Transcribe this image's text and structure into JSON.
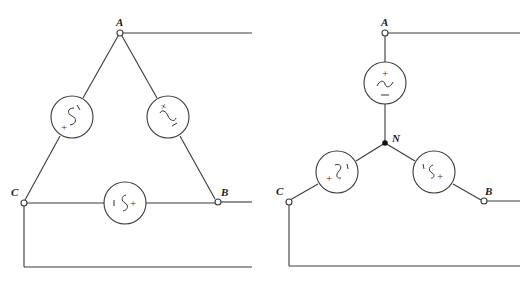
{
  "diagram": {
    "type": "three-phase source connections",
    "left": {
      "name": "delta-connected source",
      "nodes": {
        "a": "A",
        "b": "B",
        "c": "C"
      },
      "sources": [
        {
          "id": "ca",
          "between": [
            "C",
            "A"
          ],
          "plus": "+",
          "minus": "−"
        },
        {
          "id": "ab",
          "between": [
            "A",
            "B"
          ],
          "plus": "+",
          "minus": "−"
        },
        {
          "id": "bc",
          "between": [
            "B",
            "C"
          ],
          "plus": "+",
          "minus": "−"
        }
      ]
    },
    "right": {
      "name": "wye-connected source",
      "nodes": {
        "a": "A",
        "b": "B",
        "c": "C",
        "n": "N"
      },
      "sources": [
        {
          "id": "an",
          "between": [
            "A",
            "N"
          ],
          "plus": "+",
          "minus": "−"
        },
        {
          "id": "cn",
          "between": [
            "C",
            "N"
          ],
          "plus": "+",
          "minus": "−"
        },
        {
          "id": "bn",
          "between": [
            "B",
            "N"
          ],
          "plus": "+",
          "minus": "−"
        }
      ]
    }
  }
}
